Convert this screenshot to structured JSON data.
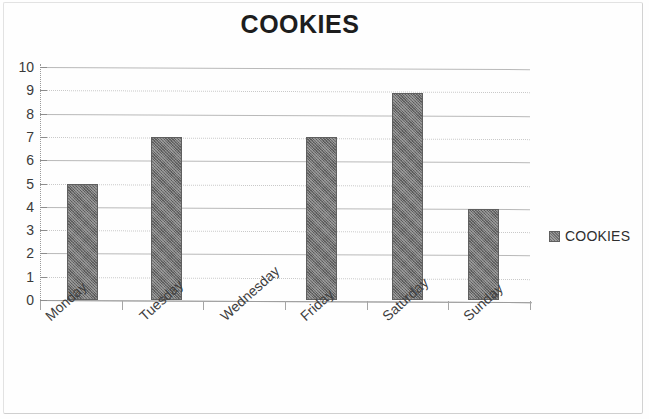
{
  "chart_data": {
    "type": "bar",
    "title": "COOKIES",
    "xlabel": "",
    "ylabel": "",
    "categories": [
      "Monday",
      "Tuesday",
      "Wednesday",
      "Friday",
      "Saturday",
      "Sunday"
    ],
    "values": [
      5,
      7,
      0,
      7,
      8.9,
      3.9
    ],
    "series": [
      {
        "name": "COOKIES",
        "values": [
          5,
          7,
          0,
          7,
          8.9,
          3.9
        ]
      }
    ],
    "ylim": [
      0,
      10
    ],
    "yticks": [
      "0",
      "1",
      "2",
      "3",
      "4",
      "5",
      "6",
      "7",
      "8",
      "9",
      "10"
    ],
    "ytick_values": [
      0,
      1,
      2,
      3,
      4,
      5,
      6,
      7,
      8,
      9,
      10
    ],
    "grid": true,
    "grid_axis": "y",
    "legend": [
      "COOKIES"
    ],
    "legend_position": "right",
    "bar_color": "#6f6f6f",
    "title_color": "#1d1d1d",
    "gridline_color": "#b9b9b9",
    "axis_color": "#9c9c9c"
  },
  "legend": {
    "label": "COOKIES"
  }
}
